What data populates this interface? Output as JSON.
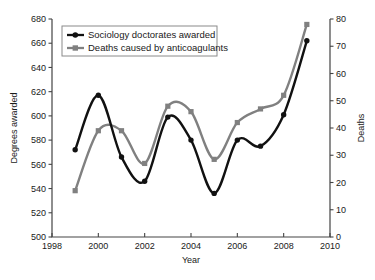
{
  "chart_data": {
    "type": "line",
    "title": "",
    "xlabel": "Year",
    "ylabel": "Degrees awarded",
    "y2label": "Deaths",
    "x": [
      1999,
      2000,
      2001,
      2002,
      2003,
      2004,
      2005,
      2006,
      2007,
      2008,
      2009
    ],
    "xlim": [
      1998,
      2010
    ],
    "xticks": [
      1998,
      2000,
      2002,
      2004,
      2006,
      2008,
      2010
    ],
    "xtick_labels": [
      "1998",
      "2000",
      "2002",
      "2004",
      "2006",
      "2008",
      "2010"
    ],
    "ylim": [
      500,
      680
    ],
    "yticks": [
      500,
      520,
      540,
      560,
      580,
      600,
      620,
      640,
      660,
      680
    ],
    "ytick_labels": [
      "500",
      "520",
      "540",
      "560",
      "580",
      "600",
      "620",
      "640",
      "660",
      "680"
    ],
    "y2lim": [
      0,
      80
    ],
    "y2ticks": [
      0,
      10,
      20,
      30,
      40,
      50,
      60,
      70,
      80
    ],
    "y2tick_labels": [
      "0",
      "10",
      "20",
      "30",
      "40",
      "50",
      "60",
      "70",
      "80"
    ],
    "grid": false,
    "legend_position": "upper-left",
    "series": [
      {
        "name": "Sociology doctorates awarded",
        "axis": "left",
        "color": "#111111",
        "marker": "circle",
        "values": [
          572,
          617,
          566,
          546,
          599,
          580,
          536,
          580,
          575,
          601,
          662
        ]
      },
      {
        "name": "Deaths caused by anticoagulants",
        "axis": "right",
        "color": "#808080",
        "marker": "square",
        "values": [
          17,
          39,
          39,
          27,
          48,
          46,
          28.5,
          42,
          47,
          52,
          78
        ]
      }
    ]
  },
  "legend": {
    "entries": [
      {
        "label": "Sociology doctorates awarded",
        "marker": "circle-marker-icon"
      },
      {
        "label": "Deaths caused by anticoagulants",
        "marker": "square-marker-icon"
      }
    ]
  },
  "axes": {
    "x_title": "Year",
    "y_left_title": "Degrees awarded",
    "y_right_title": "Deaths"
  },
  "colors": {
    "series_1": "#111111",
    "series_2": "#808080",
    "frame": "#444444",
    "text": "#1a1a1a",
    "background": "#ffffff"
  }
}
